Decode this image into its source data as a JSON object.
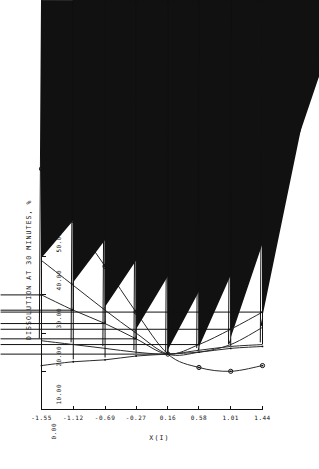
{
  "panel": {
    "label": "(b)"
  },
  "legend": {
    "separator": "-",
    "items": [
      {
        "symbol": "circle-dot",
        "label": "CALCIUM PHOSPHATE TO LACTOSE RATIO"
      },
      {
        "symbol": "triangle-filled",
        "label": "COMPRESSION PRESSURE"
      },
      {
        "symbol": "plus",
        "label": "CORN STARCH DISINTEGRANT"
      },
      {
        "symbol": "cross",
        "label": "GRANULATING GELATIN"
      },
      {
        "symbol": "diamond-dot",
        "label": "MAGNESIUM STEARATE"
      }
    ]
  },
  "chart_data": {
    "type": "line",
    "title": "",
    "xlabel": "X(I)",
    "ylabel": "DISSOLUTION AT 30 MINUTES, %",
    "xlim": [
      -1.55,
      1.44
    ],
    "ylim": [
      0.0,
      100.0
    ],
    "grid": false,
    "legend_position": "top",
    "xticks": [
      "-1.55",
      "-1.12",
      "-0.69",
      "-0.27",
      "0.16",
      "0.58",
      "1.01",
      "1.44"
    ],
    "xtick_values": [
      -1.55,
      -1.12,
      -0.69,
      -0.27,
      0.16,
      0.58,
      1.01,
      1.44
    ],
    "yticks": [
      "0.00",
      "10.00",
      "20.00",
      "30.00",
      "40.00",
      "50.00",
      "60.00",
      "70.00",
      "80.00",
      "90.00",
      "100.00"
    ],
    "ytick_values": [
      0,
      10,
      20,
      30,
      40,
      50,
      60,
      70,
      80,
      90,
      100
    ],
    "x": [
      -1.55,
      -1.12,
      -0.69,
      -0.27,
      0.16,
      0.58,
      1.01,
      1.44
    ],
    "series": [
      {
        "name": "CALCIUM PHOSPHATE TO LACTOSE RATIO",
        "marker": "circle-dot",
        "values": [
          63.0,
          49.5,
          37.5,
          25.5,
          14.5,
          11.0,
          10.0,
          11.5
        ]
      },
      {
        "name": "COMPRESSION PRESSURE",
        "marker": "triangle-filled",
        "values": [
          39.0,
          32.5,
          26.0,
          20.0,
          14.5,
          15.0,
          17.0,
          21.5
        ]
      },
      {
        "name": "CORN STARCH DISINTEGRANT",
        "marker": "plus",
        "values": [
          30.0,
          26.0,
          22.5,
          18.5,
          14.5,
          17.0,
          21.0,
          25.5
        ]
      },
      {
        "name": "GRANULATING GELATIN",
        "marker": "cross",
        "values": [
          18.0,
          17.0,
          16.0,
          15.0,
          14.5,
          15.5,
          16.5,
          17.0
        ]
      },
      {
        "name": "MAGNESIUM STEARATE",
        "marker": "diamond-dot",
        "values": [
          11.5,
          12.5,
          13.0,
          14.0,
          14.5,
          15.0,
          16.0,
          16.5
        ]
      }
    ]
  }
}
